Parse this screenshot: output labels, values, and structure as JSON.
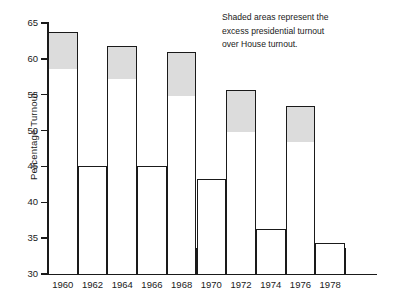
{
  "chart_data": {
    "type": "bar",
    "title": "",
    "xlabel": "",
    "ylabel": "Percentage Turnout",
    "ylim": [
      30,
      65
    ],
    "ytick_values": [
      30,
      35,
      40,
      45,
      50,
      55,
      60,
      65
    ],
    "ytick_labels": [
      "30",
      "35",
      "40",
      "45",
      "50",
      "55",
      "60",
      "65"
    ],
    "grid": false,
    "legend": null,
    "categories": [
      "1960",
      "1962",
      "1964",
      "1966",
      "1968",
      "1970",
      "1972",
      "1974",
      "1976",
      "1978"
    ],
    "values": [
      63.7,
      45.0,
      61.8,
      45.0,
      61.0,
      43.2,
      55.7,
      36.3,
      53.4,
      34.3
    ],
    "series": [
      {
        "name": "Total turnout",
        "values": [
          63.7,
          45.0,
          61.8,
          45.0,
          61.0,
          43.2,
          55.7,
          36.3,
          53.4,
          34.3
        ]
      },
      {
        "name": "House turnout (unshaded portion of presidential-year bars)",
        "values": [
          58.7,
          45.0,
          57.3,
          45.0,
          55.0,
          43.2,
          50.0,
          36.3,
          48.5,
          34.3
        ]
      }
    ],
    "shaded_years": [
      "1960",
      "1964",
      "1968",
      "1972",
      "1976"
    ],
    "annotation": {
      "lines": [
        "Shaded areas represent the",
        "excess presidential turnout",
        "over House turnout."
      ]
    },
    "colors": {
      "shade": "#dcdcdc",
      "bar_fill": "#ffffff",
      "bar_outline": "#1a1a1a",
      "axis": "#1a1a1a",
      "background": "#ffffff"
    }
  }
}
